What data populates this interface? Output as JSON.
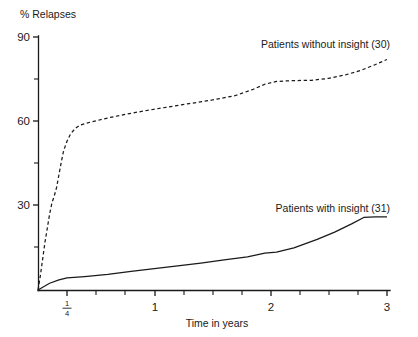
{
  "chart_data": {
    "type": "line",
    "title": "",
    "xlabel": "Time in years",
    "ylabel": "% Relapses",
    "xlim": [
      0,
      3
    ],
    "ylim": [
      0,
      90
    ],
    "grid": false,
    "legend_position": "inline-annotations",
    "y_ticks": [
      {
        "value": 0,
        "label": ""
      },
      {
        "value": 15,
        "label": ""
      },
      {
        "value": 30,
        "label": "30"
      },
      {
        "value": 45,
        "label": ""
      },
      {
        "value": 60,
        "label": "60"
      },
      {
        "value": 75,
        "label": ""
      },
      {
        "value": 90,
        "label": "90"
      }
    ],
    "x_ticks": [
      {
        "value": 0.25,
        "label": "1/4",
        "numerator": "1",
        "denominator": "4"
      },
      {
        "value": 0.5,
        "label": ""
      },
      {
        "value": 0.75,
        "label": ""
      },
      {
        "value": 1,
        "label": "1"
      },
      {
        "value": 1.25,
        "label": ""
      },
      {
        "value": 1.5,
        "label": ""
      },
      {
        "value": 1.75,
        "label": ""
      },
      {
        "value": 2,
        "label": "2"
      },
      {
        "value": 2.25,
        "label": ""
      },
      {
        "value": 2.5,
        "label": ""
      },
      {
        "value": 2.75,
        "label": ""
      },
      {
        "value": 3,
        "label": "3"
      }
    ],
    "series": [
      {
        "name": "Patients without insight (30)",
        "style": "dashed",
        "color": "#1a1a1a",
        "n": 30,
        "annotation": "Patients without insight (30)",
        "points": [
          [
            0.0,
            0.0
          ],
          [
            0.02,
            5.0
          ],
          [
            0.04,
            11.0
          ],
          [
            0.06,
            17.0
          ],
          [
            0.08,
            22.0
          ],
          [
            0.1,
            27.0
          ],
          [
            0.12,
            31.0
          ],
          [
            0.14,
            33.5
          ],
          [
            0.16,
            36.5
          ],
          [
            0.18,
            41.0
          ],
          [
            0.2,
            45.5
          ],
          [
            0.22,
            49.5
          ],
          [
            0.25,
            53.0
          ],
          [
            0.28,
            55.5
          ],
          [
            0.32,
            57.5
          ],
          [
            0.36,
            58.6
          ],
          [
            0.42,
            59.4
          ],
          [
            0.5,
            60.2
          ],
          [
            0.6,
            61.2
          ],
          [
            0.75,
            62.5
          ],
          [
            0.9,
            63.6
          ],
          [
            1.1,
            65.0
          ],
          [
            1.3,
            66.3
          ],
          [
            1.5,
            67.6
          ],
          [
            1.7,
            69.2
          ],
          [
            1.85,
            71.4
          ],
          [
            1.95,
            73.2
          ],
          [
            2.05,
            74.2
          ],
          [
            2.2,
            74.5
          ],
          [
            2.35,
            74.6
          ],
          [
            2.5,
            75.3
          ],
          [
            2.65,
            76.6
          ],
          [
            2.78,
            78.2
          ],
          [
            2.9,
            80.2
          ],
          [
            3.0,
            82.0
          ]
        ]
      },
      {
        "name": "Patients with insight (31)",
        "style": "solid",
        "color": "#1a1a1a",
        "n": 31,
        "annotation": "Patients with insight (31)",
        "points": [
          [
            0.0,
            0.0
          ],
          [
            0.1,
            2.4
          ],
          [
            0.18,
            3.6
          ],
          [
            0.25,
            4.3
          ],
          [
            0.4,
            4.8
          ],
          [
            0.6,
            5.6
          ],
          [
            0.8,
            6.6
          ],
          [
            1.0,
            7.6
          ],
          [
            1.2,
            8.6
          ],
          [
            1.4,
            9.6
          ],
          [
            1.6,
            10.7
          ],
          [
            1.8,
            11.8
          ],
          [
            1.95,
            13.1
          ],
          [
            2.05,
            13.5
          ],
          [
            2.2,
            15.0
          ],
          [
            2.4,
            18.0
          ],
          [
            2.55,
            20.6
          ],
          [
            2.7,
            23.6
          ],
          [
            2.8,
            25.8
          ],
          [
            2.9,
            26.0
          ],
          [
            3.0,
            26.0
          ]
        ]
      }
    ]
  },
  "annotations": {
    "without_insight": "Patients without insight (30)",
    "with_insight": "Patients with insight (31)"
  }
}
